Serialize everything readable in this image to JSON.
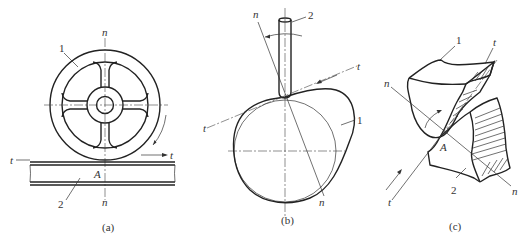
{
  "figure": {
    "panels": [
      {
        "id": "a",
        "caption": "(a)",
        "description": "Wheel rolling on rail (friction wheel pair)",
        "labels": {
          "part1": "1",
          "part2": "2",
          "normal_top": "n",
          "normal_bottom": "n",
          "tangent_left": "t",
          "tangent_right": "t",
          "contact": "A"
        }
      },
      {
        "id": "b",
        "caption": "(b)",
        "description": "Cam with pointed follower",
        "labels": {
          "part1": "1",
          "part2": "2",
          "normal_top": "n",
          "normal_bottom": "n",
          "tangent_left": "t",
          "tangent_right": "t"
        }
      },
      {
        "id": "c",
        "caption": "(c)",
        "description": "Gear teeth in mesh (higher pair contact)",
        "labels": {
          "part1": "1",
          "part2": "2",
          "normal_top": "n",
          "normal_bottom": "n",
          "tangent_top": "t",
          "tangent_bottom": "t",
          "contact": "A"
        }
      }
    ]
  }
}
